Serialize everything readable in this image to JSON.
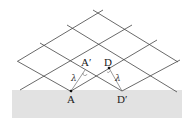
{
  "diagram": {
    "title": "",
    "labels": {
      "A": "A",
      "A_prime": "A′",
      "D": "D",
      "D_prime": "D′",
      "lambda_left": "λ",
      "lambda_right": "λ"
    },
    "colors": {
      "surface": "#e2e2e2",
      "lines": "#444444",
      "text": "#222222"
    }
  }
}
